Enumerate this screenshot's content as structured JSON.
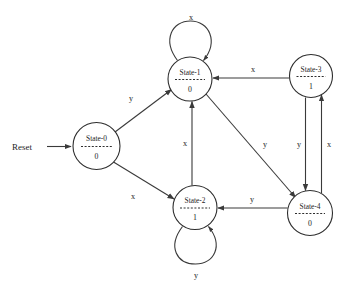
{
  "diagram": {
    "type": "finite-state-machine",
    "reset": {
      "label": "Reset",
      "target": "State-0"
    },
    "stroke_color": "#3a3a3a",
    "text_color": "#1d1d1d",
    "background": "#ffffff",
    "states": [
      {
        "id": "s0",
        "name": "State-0",
        "output": "0",
        "cx": 96.5,
        "cy": 146,
        "r": 23.5
      },
      {
        "id": "s1",
        "name": "State-1",
        "output": "0",
        "cx": 190,
        "cy": 79,
        "r": 22
      },
      {
        "id": "s2",
        "name": "State-2",
        "output": "1",
        "cx": 195,
        "cy": 207.5,
        "r": 22
      },
      {
        "id": "s3",
        "name": "State-3",
        "output": "1",
        "cx": 311,
        "cy": 76,
        "r": 21.5
      },
      {
        "id": "s4",
        "name": "State-4",
        "output": "0",
        "cx": 310,
        "cy": 213,
        "r": 22.5
      }
    ],
    "transitions": [
      {
        "id": "t0",
        "from": "State-0",
        "to": "State-1",
        "label": "y",
        "label_x": 131,
        "label_y": 101
      },
      {
        "id": "t1",
        "from": "State-0",
        "to": "State-2",
        "label": "x",
        "label_x": 133,
        "label_y": 199
      },
      {
        "id": "t2",
        "from": "State-1",
        "to": "State-1",
        "label": "x",
        "label_x": 191,
        "label_y": 20,
        "self_loop": true
      },
      {
        "id": "t3",
        "from": "State-2",
        "to": "State-2",
        "label": "y",
        "label_x": 196,
        "label_y": 278,
        "self_loop": true
      },
      {
        "id": "t4",
        "from": "State-2",
        "to": "State-1",
        "label": "x",
        "label_x": 186,
        "label_y": 146
      },
      {
        "id": "t5",
        "from": "State-3",
        "to": "State-1",
        "label": "x",
        "label_x": 253,
        "label_y": 72
      },
      {
        "id": "t6",
        "from": "State-1",
        "to": "State-4",
        "label": "y",
        "label_x": 265,
        "label_y": 147
      },
      {
        "id": "t7",
        "from": "State-3",
        "to": "State-4",
        "label": "y",
        "label_x": 299,
        "label_y": 147
      },
      {
        "id": "t8",
        "from": "State-4",
        "to": "State-3",
        "label": "x",
        "label_x": 329,
        "label_y": 147
      },
      {
        "id": "t9",
        "from": "State-4",
        "to": "State-2",
        "label": "y",
        "label_x": 252,
        "label_y": 202
      }
    ]
  }
}
